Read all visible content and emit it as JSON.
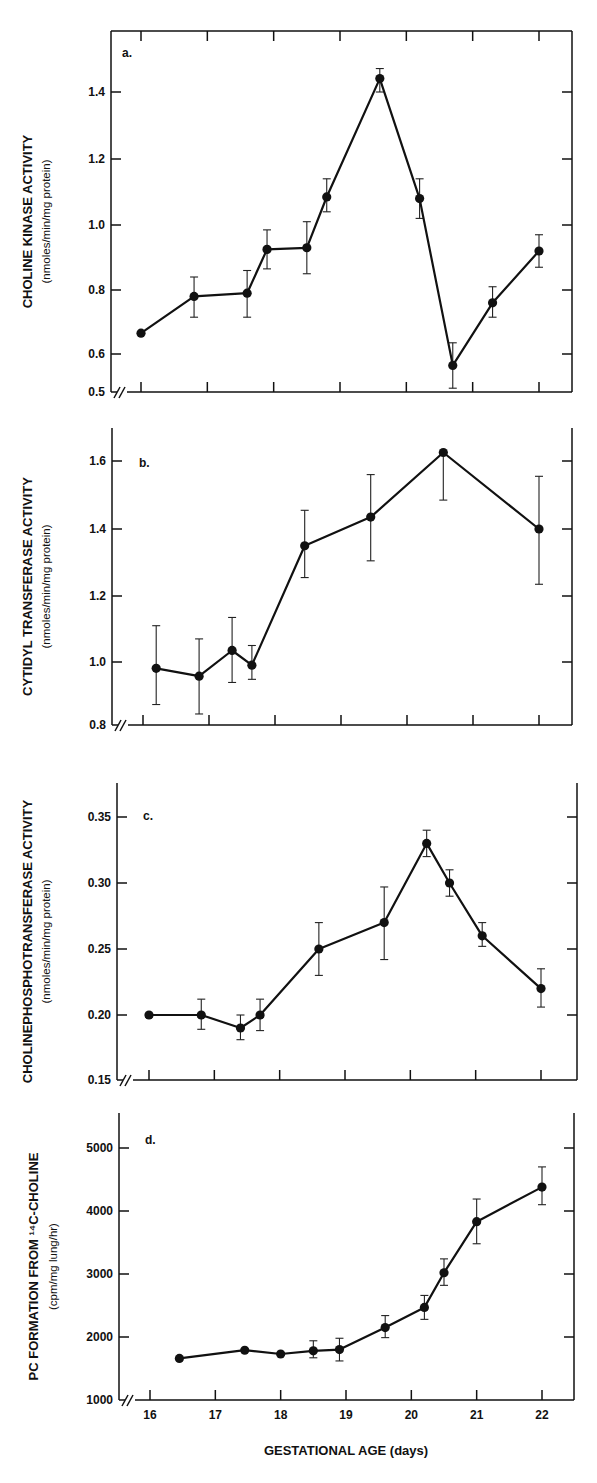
{
  "figure": {
    "xlabel": "GESTATIONAL AGE (days)",
    "x_tick_labels": [
      "16",
      "17",
      "18",
      "19",
      "20",
      "21",
      "22"
    ]
  },
  "chart_data": [
    {
      "type": "line",
      "panel": "a.",
      "title": "",
      "ylabel": "CHOLINE KINASE ACTIVITY",
      "ylabel_units": "(nmoles/min/mg protein)",
      "xlabel": "GESTATIONAL AGE (days)",
      "ylim": [
        0.5,
        1.55
      ],
      "xlim": [
        15.8,
        22.5
      ],
      "y_ticks": [
        0.5,
        0.6,
        0.8,
        1.0,
        1.2,
        1.4
      ],
      "y_tick_labels": [
        "0.5",
        "0.6",
        "0.8",
        "1.0",
        "1.2",
        "1.4"
      ],
      "axis_break": true,
      "grid": false,
      "x": [
        16.0,
        16.8,
        17.6,
        17.9,
        18.5,
        18.8,
        19.6,
        20.2,
        20.7,
        21.3,
        22.0
      ],
      "y": [
        0.665,
        0.78,
        0.79,
        0.925,
        0.93,
        1.085,
        1.44,
        1.08,
        0.57,
        0.76,
        0.92
      ],
      "err_upper": [
        null,
        0.84,
        0.86,
        0.985,
        1.01,
        1.14,
        1.47,
        1.14,
        0.635,
        0.81,
        0.97
      ],
      "err_lower": [
        null,
        0.715,
        0.715,
        0.865,
        0.85,
        1.04,
        1.4,
        1.02,
        0.51,
        0.715,
        0.87
      ]
    },
    {
      "type": "line",
      "panel": "b.",
      "title": "",
      "ylabel": "CYTIDYL TRANSFERASE ACTIVITY",
      "ylabel_units": "(nmoles/min/mg protein)",
      "xlabel": "GESTATIONAL AGE (days)",
      "ylim": [
        0.8,
        1.7
      ],
      "xlim": [
        15.8,
        22.5
      ],
      "y_ticks": [
        0.8,
        1.0,
        1.2,
        1.4,
        1.6
      ],
      "y_tick_labels": [
        "0.8",
        "1.0",
        "1.2",
        "1.4",
        "1.6"
      ],
      "axis_break": true,
      "grid": false,
      "x": [
        16.2,
        16.85,
        17.35,
        17.65,
        18.45,
        19.45,
        20.55,
        22.0
      ],
      "y": [
        0.98,
        0.955,
        1.035,
        0.99,
        1.35,
        1.435,
        1.625,
        1.4
      ],
      "err_upper": [
        1.11,
        1.07,
        1.135,
        1.05,
        1.455,
        1.56,
        1.625,
        1.555
      ],
      "err_lower": [
        0.865,
        0.835,
        0.935,
        0.945,
        1.255,
        1.305,
        1.485,
        1.235
      ]
    },
    {
      "type": "line",
      "panel": "c.",
      "title": "",
      "ylabel": "CHOLINEPHOSPHOTRANSFERASE ACTIVITY",
      "ylabel_units": "(nmoles/min/mg protein)",
      "xlabel": "GESTATIONAL AGE (days)",
      "ylim": [
        0.15,
        0.375
      ],
      "xlim": [
        15.8,
        22.5
      ],
      "y_ticks": [
        0.15,
        0.2,
        0.25,
        0.3,
        0.35
      ],
      "y_tick_labels": [
        "0.15",
        "0.20",
        "0.25",
        "0.30",
        "0.35"
      ],
      "axis_break": true,
      "grid": false,
      "x": [
        16.0,
        16.8,
        17.4,
        17.7,
        18.6,
        19.6,
        20.25,
        20.6,
        21.1,
        22.0
      ],
      "y": [
        0.2,
        0.2,
        0.19,
        0.2,
        0.25,
        0.27,
        0.33,
        0.3,
        0.26,
        0.22
      ],
      "err_upper": [
        null,
        0.212,
        0.2,
        0.212,
        0.27,
        0.297,
        0.34,
        0.31,
        0.27,
        0.235
      ],
      "err_lower": [
        null,
        0.189,
        0.181,
        0.188,
        0.23,
        0.242,
        0.32,
        0.29,
        0.252,
        0.206
      ]
    },
    {
      "type": "line",
      "panel": "d.",
      "title": "",
      "ylabel": "PC FORMATION FROM ¹⁴C-CHOLINE",
      "ylabel_units": "(cpm/mg lung/hr)",
      "xlabel": "GESTATIONAL AGE (days)",
      "ylim": [
        1000,
        5600
      ],
      "xlim": [
        15.8,
        22.5
      ],
      "y_ticks": [
        1000,
        2000,
        3000,
        4000,
        5000
      ],
      "y_tick_labels": [
        "1000",
        "2000",
        "3000",
        "4000",
        "5000"
      ],
      "x_ticks": [
        16,
        17,
        18,
        19,
        20,
        21,
        22
      ],
      "x_tick_labels": [
        "16",
        "17",
        "18",
        "19",
        "20",
        "21",
        "22"
      ],
      "axis_break": true,
      "grid": false,
      "x": [
        16.45,
        17.45,
        18.0,
        18.5,
        18.9,
        19.6,
        20.2,
        20.5,
        21.0,
        22.0
      ],
      "y": [
        1660,
        1790,
        1730,
        1780,
        1800,
        2150,
        2470,
        3020,
        3830,
        4380
      ],
      "err_upper": [
        null,
        null,
        null,
        1940,
        1980,
        2340,
        2660,
        3240,
        4190,
        4700
      ],
      "err_lower": [
        null,
        null,
        null,
        1670,
        1620,
        1990,
        2280,
        2820,
        3480,
        4100
      ]
    }
  ],
  "layout_panels": [
    {
      "left": 111,
      "right": 572,
      "top": 31,
      "bottom": 392,
      "box_top": true,
      "x16": 141,
      "x22": 539,
      "ymap": [
        [
          0.5,
          392
        ],
        [
          0.6,
          354
        ],
        [
          0.8,
          290
        ],
        [
          1.0,
          225
        ],
        [
          1.2,
          159
        ],
        [
          1.4,
          92
        ]
      ],
      "letter_xy": [
        122,
        57
      ],
      "ytitle_x": 32,
      "ysub_x": 50
    },
    {
      "left": 112,
      "right": 572,
      "top": 428,
      "bottom": 725,
      "box_top": false,
      "x16": 143,
      "x22": 539,
      "ymap": [
        [
          0.8,
          725
        ],
        [
          1.0,
          662
        ],
        [
          1.2,
          596
        ],
        [
          1.4,
          529
        ],
        [
          1.6,
          461
        ]
      ],
      "letter_xy": [
        139,
        467
      ],
      "ytitle_x": 32,
      "ysub_x": 50
    },
    {
      "left": 117,
      "right": 577,
      "top": 783,
      "bottom": 1080,
      "box_top": false,
      "x16": 149,
      "x22": 541,
      "ymap": [
        [
          0.15,
          1080
        ],
        [
          0.2,
          1015
        ],
        [
          0.25,
          949
        ],
        [
          0.3,
          883
        ],
        [
          0.35,
          817
        ]
      ],
      "letter_xy": [
        143,
        820
      ],
      "ytitle_x": 32,
      "ysub_x": 50
    },
    {
      "left": 119,
      "right": 574,
      "top": 1113,
      "bottom": 1400,
      "box_top": false,
      "x16": 150,
      "x22": 542,
      "ymap": [
        [
          1000,
          1400
        ],
        [
          2000,
          1337
        ],
        [
          3000,
          1274
        ],
        [
          4000,
          1211
        ],
        [
          5000,
          1148
        ]
      ],
      "letter_xy": [
        145,
        1144
      ],
      "ytitle_x": 38,
      "ysub_x": 57
    }
  ]
}
